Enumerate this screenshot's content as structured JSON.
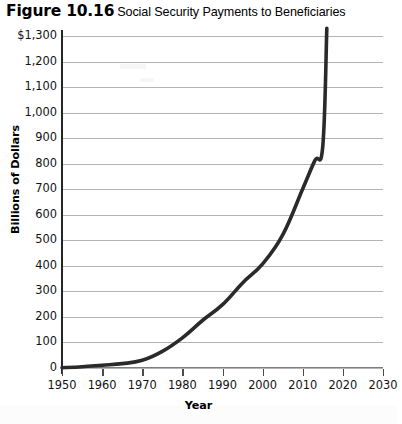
{
  "figure": {
    "number": "Figure 10.16",
    "caption": "Social Security Payments to Beneficiaries"
  },
  "chart_data": {
    "type": "line",
    "title": "Social Security Payments to Beneficiaries",
    "xlabel": "Year",
    "ylabel": "Billions of Dollars",
    "xlim": [
      1950,
      2030
    ],
    "ylim": [
      0,
      1300
    ],
    "grid": true,
    "legend": "none",
    "y_tick_labels": [
      "$1,300",
      "1,200",
      "1,100",
      "1,000",
      "900",
      "800",
      "700",
      "600",
      "500",
      "400",
      "300",
      "200",
      "100",
      "0"
    ],
    "y_ticks": [
      1300,
      1200,
      1100,
      1000,
      900,
      800,
      700,
      600,
      500,
      400,
      300,
      200,
      100,
      0
    ],
    "x_tick_labels": [
      "1950",
      "1960",
      "1970",
      "1980",
      "1990",
      "2000",
      "2010",
      "2020",
      "2030"
    ],
    "x_ticks": [
      1950,
      1960,
      1970,
      1980,
      1990,
      2000,
      2010,
      2020,
      2030
    ],
    "series": [
      {
        "name": "Social Security payments",
        "x": [
          1950,
          1955,
          1960,
          1965,
          1970,
          1975,
          1980,
          1985,
          1990,
          1995,
          2000,
          2005,
          2010,
          2013,
          2015,
          2016
        ],
        "values": [
          1,
          5,
          11,
          17,
          30,
          65,
          118,
          186,
          248,
          333,
          408,
          521,
          702,
          812,
          870,
          1330
        ]
      }
    ]
  },
  "axis_color": "#262626",
  "grid_color": "#b4b4b4",
  "line_color": "#2a2a2a"
}
